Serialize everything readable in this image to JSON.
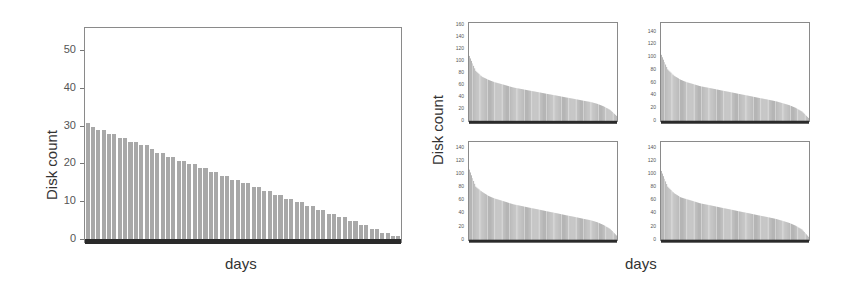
{
  "chart_data": [
    {
      "type": "bar",
      "title": "",
      "xlabel": "days",
      "ylabel": "Disk count",
      "ylim": [
        -1,
        56
      ],
      "yticks": [
        0,
        10,
        20,
        30,
        40,
        50
      ],
      "xticks": [],
      "grid": false,
      "legend": null,
      "values": [
        31,
        30,
        29,
        29,
        28,
        28,
        27,
        27,
        26,
        26,
        25,
        25,
        24,
        23,
        23,
        22,
        22,
        21,
        21,
        20,
        20,
        19,
        19,
        18,
        18,
        17,
        17,
        16,
        16,
        15,
        15,
        14,
        14,
        13,
        13,
        12,
        12,
        11,
        11,
        10,
        10,
        9,
        9,
        8,
        8,
        7,
        7,
        6,
        6,
        5,
        5,
        4,
        4,
        3,
        3,
        2,
        2,
        1,
        1
      ]
    },
    {
      "type": "bar",
      "title": "",
      "subplot": "top-left",
      "xlabel": "days",
      "ylabel": "Disk count",
      "ylim": [
        -2,
        165
      ],
      "yticks": [
        0,
        20,
        40,
        60,
        80,
        100,
        120,
        140,
        160
      ],
      "grid": false,
      "shape": "sorted descending, many thin bars",
      "values_sampled": [
        110,
        85,
        75,
        70,
        66,
        63,
        60,
        57,
        55,
        53,
        51,
        49,
        47,
        45,
        43,
        41,
        39,
        37,
        35,
        33,
        30,
        26,
        20,
        10
      ]
    },
    {
      "type": "bar",
      "title": "",
      "subplot": "top-right",
      "xlabel": "days",
      "ylabel": "Disk count",
      "ylim": [
        -2,
        155
      ],
      "yticks": [
        0,
        20,
        40,
        60,
        80,
        100,
        120,
        140
      ],
      "grid": false,
      "shape": "sorted descending, many thin bars",
      "values_sampled": [
        105,
        82,
        72,
        66,
        62,
        59,
        56,
        54,
        52,
        50,
        48,
        46,
        44,
        42,
        40,
        38,
        36,
        34,
        32,
        29,
        26,
        22,
        16,
        6
      ]
    },
    {
      "type": "bar",
      "title": "",
      "subplot": "bottom-left",
      "xlabel": "days",
      "ylabel": "Disk count",
      "ylim": [
        -2,
        150
      ],
      "yticks": [
        0,
        20,
        40,
        60,
        80,
        100,
        120,
        140
      ],
      "grid": false,
      "shape": "sorted descending, many thin bars",
      "values_sampled": [
        108,
        82,
        74,
        68,
        64,
        61,
        58,
        55,
        53,
        51,
        49,
        47,
        45,
        43,
        41,
        39,
        37,
        35,
        33,
        31,
        28,
        24,
        18,
        8
      ]
    },
    {
      "type": "bar",
      "title": "",
      "subplot": "bottom-right",
      "xlabel": "days",
      "ylabel": "Disk count",
      "ylim": [
        -2,
        150
      ],
      "yticks": [
        0,
        20,
        40,
        60,
        80,
        100,
        120,
        140
      ],
      "grid": false,
      "shape": "sorted descending, many thin bars",
      "values_sampled": [
        106,
        82,
        72,
        66,
        63,
        60,
        57,
        55,
        53,
        51,
        49,
        47,
        45,
        43,
        41,
        39,
        37,
        35,
        33,
        30,
        27,
        23,
        17,
        6
      ]
    }
  ],
  "labels": {
    "left_ylabel": "Disk count",
    "left_xlabel": "days",
    "right_ylabel": "Disk count",
    "right_xlabel": "days"
  },
  "colors": {
    "bar": "#a8a8a8",
    "baseline": "#2a2a2a",
    "frame": "#8a8a8a",
    "text": "#333333"
  }
}
